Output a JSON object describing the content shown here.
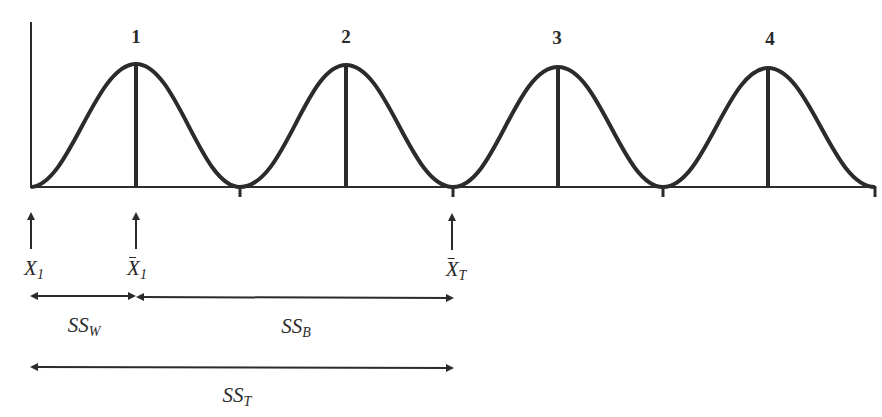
{
  "diagram": {
    "title": "",
    "stroke_color": "#2b2b2b",
    "groups": [
      {
        "label": "1",
        "peak_x": 136
      },
      {
        "label": "2",
        "peak_x": 346
      },
      {
        "label": "3",
        "peak_x": 558
      },
      {
        "label": "4",
        "peak_x": 768
      }
    ],
    "markers": [
      {
        "symbol": "X",
        "subscript": "1",
        "bar": false,
        "name": "individual score"
      },
      {
        "symbol": "X",
        "subscript": "1",
        "bar": true,
        "name": "group 1 mean"
      },
      {
        "symbol": "X",
        "subscript": "T",
        "bar": true,
        "name": "grand mean"
      }
    ],
    "spans": [
      {
        "symbol": "SS",
        "subscript": "W",
        "from": "X1",
        "to": "X̄1"
      },
      {
        "symbol": "SS",
        "subscript": "B",
        "from": "X̄1",
        "to": "X̄T"
      },
      {
        "symbol": "SS",
        "subscript": "T",
        "from": "X1",
        "to": "X̄T"
      }
    ]
  }
}
